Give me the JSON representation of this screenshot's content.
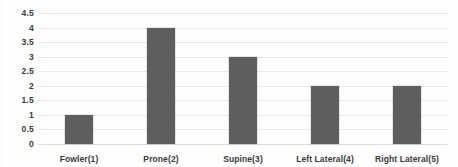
{
  "chart_data": {
    "type": "bar",
    "title": "",
    "xlabel": "",
    "ylabel": "",
    "categories": [
      "Fowler(1)",
      "Prone(2)",
      "Supine(3)",
      "Left Lateral(4)",
      "Right Lateral(5)"
    ],
    "values": [
      1,
      4,
      3,
      2,
      2
    ],
    "ylim": [
      0,
      4.5
    ],
    "yticks": [
      "0",
      "0.5",
      "1",
      "1.5",
      "2",
      "2.5",
      "3",
      "3.5",
      "4",
      "4.5"
    ],
    "ytick_values": [
      0,
      0.5,
      1,
      1.5,
      2,
      2.5,
      3,
      3.5,
      4,
      4.5
    ],
    "grid": true,
    "legend": false,
    "series": [
      {
        "name": "",
        "values": [
          1,
          4,
          3,
          2,
          2
        ]
      }
    ],
    "colors": {
      "bar": "#5f5f5f",
      "gridline": "#e9e9e9",
      "axis_text": "#3a3a3a",
      "background": "#fefefe"
    }
  }
}
